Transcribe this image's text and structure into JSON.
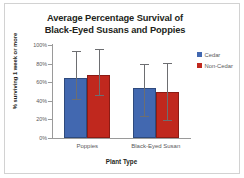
{
  "chart_data": {
    "type": "bar",
    "title": "Average Percentage Survival of Black-Eyed Susans and Poppies",
    "title_lines": [
      "Average Percentage Survival of",
      "Black-Eyed Susans and Poppies"
    ],
    "xlabel": "Plant Type",
    "ylabel": "% surviving 1 week or more",
    "categories": [
      "Poppies",
      "Black-Eyed Susan"
    ],
    "ylim": [
      0,
      100
    ],
    "yticks": [
      0,
      20,
      40,
      60,
      80,
      100
    ],
    "ytick_labels": [
      "0%",
      "20%",
      "40%",
      "60%",
      "80%",
      "100%"
    ],
    "grid": false,
    "legend_position": "right",
    "series": [
      {
        "name": "Cedar",
        "color": "#4268b0",
        "values": [
          65,
          54
        ],
        "error_low": [
          41,
          23
        ],
        "error_high": [
          92,
          78
        ]
      },
      {
        "name": "Non-Cedar",
        "color": "#c0281e",
        "values": [
          68,
          50
        ],
        "error_low": [
          45,
          18
        ],
        "error_high": [
          95,
          80
        ]
      }
    ]
  },
  "legend": {
    "items": [
      {
        "label": "Cedar",
        "color": "#4268b0"
      },
      {
        "label": "Non-Cedar",
        "color": "#c0281e"
      }
    ]
  },
  "colors": {
    "cedar": "#4268b0",
    "non_cedar": "#c0281e",
    "axis": "#9a9a9a",
    "error_bar": "#6d6e71",
    "text": "#58595b",
    "title_text": "#231f20",
    "frame": "#d2d2d2",
    "background": "#ffffff"
  }
}
